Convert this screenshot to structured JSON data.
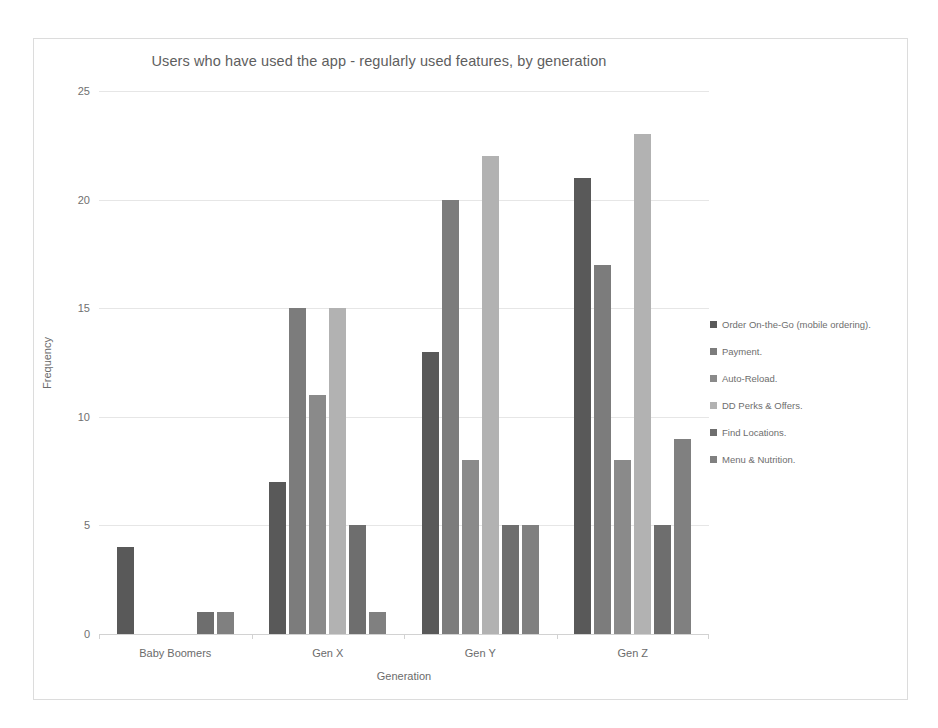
{
  "chart_data": {
    "type": "bar",
    "title": "Users who have used the app - regularly used features, by generation",
    "xlabel": "Generation",
    "ylabel": "Frequency",
    "categories": [
      "Baby Boomers",
      "Gen X",
      "Gen Y",
      "Gen Z"
    ],
    "ylim": [
      0,
      25
    ],
    "yticks": [
      0,
      5,
      10,
      15,
      20,
      25
    ],
    "grid": true,
    "legend_position": "right",
    "series": [
      {
        "name": "Order On-the-Go (mobile ordering).",
        "color": "#595959",
        "values": [
          4,
          7,
          13,
          21
        ]
      },
      {
        "name": "Payment.",
        "color": "#7c7c7c",
        "values": [
          0,
          15,
          20,
          17
        ]
      },
      {
        "name": "Auto-Reload.",
        "color": "#8a8a8a",
        "values": [
          0,
          11,
          8,
          8
        ]
      },
      {
        "name": "DD Perks & Offers.",
        "color": "#b2b2b2",
        "values": [
          0,
          15,
          22,
          23
        ]
      },
      {
        "name": "Find Locations.",
        "color": "#6e6e6e",
        "values": [
          1,
          5,
          5,
          5
        ]
      },
      {
        "name": "Menu & Nutrition.",
        "color": "#808080",
        "values": [
          1,
          1,
          5,
          9
        ]
      }
    ]
  }
}
